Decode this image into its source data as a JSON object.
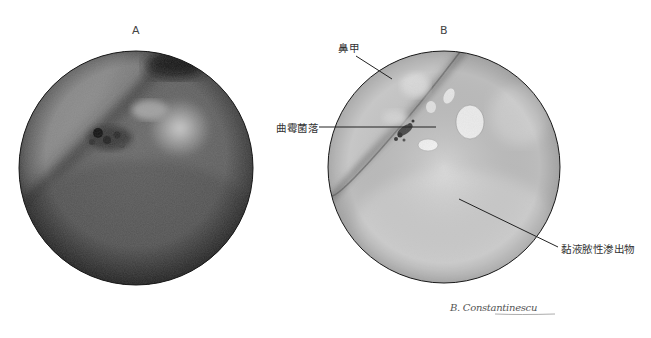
{
  "figure": {
    "panels": [
      {
        "id": "A",
        "label": "A",
        "type": "endoscopic-photograph"
      },
      {
        "id": "B",
        "label": "B",
        "type": "illustration"
      }
    ],
    "annotations": [
      {
        "id": "turbinate",
        "text": "鼻甲",
        "panel": "B"
      },
      {
        "id": "aspergillus-colony",
        "text": "曲霉菌落",
        "panel": "B"
      },
      {
        "id": "mucopurulent-exudate",
        "text": "黏液脓性渗出物",
        "panel": "B"
      }
    ],
    "signature": "B. Constantinescu",
    "colors": {
      "background": "#ffffff",
      "photo_dark": "#2a2a2a",
      "photo_mid": "#6e6e6e",
      "photo_light": "#c8c8c8",
      "drawing_base": "#c4c4c4",
      "drawing_light": "#e6e6e6",
      "outline": "#222222"
    }
  }
}
